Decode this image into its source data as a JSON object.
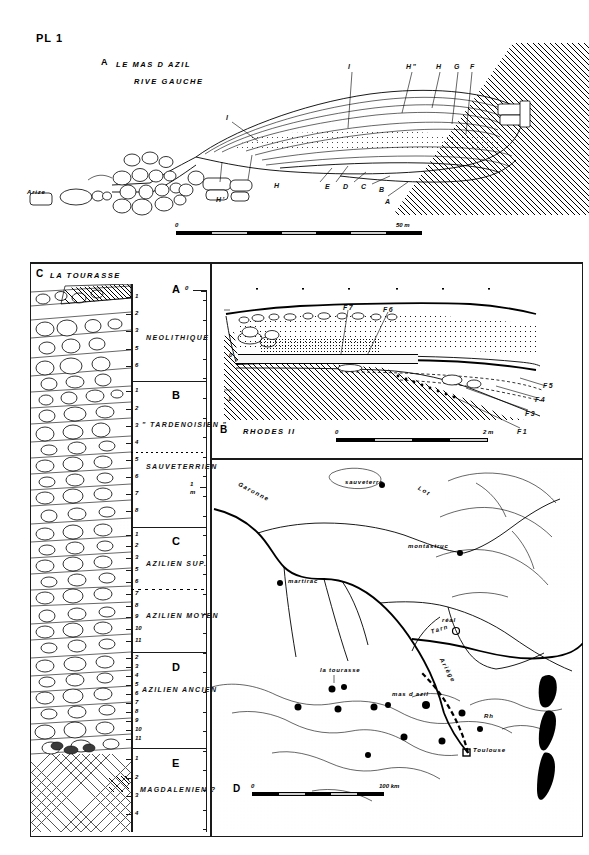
{
  "plate": {
    "number": "PL 1"
  },
  "panel_a": {
    "letter": "A",
    "title": "LE MAS D AZIL",
    "subtitle": "RIVE GAUCHE",
    "river_label": "Arize",
    "upper_labels": [
      "I",
      "H\"",
      "H",
      "G",
      "F"
    ],
    "lower_labels": [
      "H'",
      "H",
      "E",
      "D",
      "C",
      "B",
      "A"
    ],
    "scale": {
      "start": "0",
      "end": "50 m",
      "segments": 6
    }
  },
  "panel_c": {
    "letter": "C",
    "title": "LA TOURASSE",
    "depth_top": "0",
    "depth_mid": "1",
    "depth_mid_unit": "m",
    "zones": [
      {
        "letter": "A",
        "name": "NEOLITHIQUE",
        "layers": [
          "1",
          "2",
          "3",
          "5",
          "6"
        ]
      },
      {
        "letter": "B",
        "name": "\" TARDENOISIEN \"",
        "name2": "SAUVETERRIEN",
        "layers": [
          "1",
          "2",
          "3",
          "4",
          "5",
          "6",
          "7",
          "8"
        ]
      },
      {
        "letter": "C",
        "name": "AZILIEN SUP.",
        "name2": "AZILIEN MOYEN",
        "layers": [
          "1",
          "2",
          "3",
          "5",
          "6",
          "7",
          "8",
          "9",
          "10",
          "11"
        ]
      },
      {
        "letter": "D",
        "name": "AZILIEN ANCIEN",
        "layers": [
          "2",
          "3",
          "4",
          "5",
          "6",
          "7",
          "8",
          "9",
          "10",
          "11"
        ]
      },
      {
        "letter": "E",
        "name": "MAGDALENIEN ?",
        "layers": [
          "1",
          "2",
          "3",
          "4"
        ]
      }
    ]
  },
  "panel_b": {
    "letter": "B",
    "title": "RHODES II",
    "level_top": "0",
    "level_bottom": "-1",
    "labels": [
      "F7",
      "F6",
      "F5",
      "F4",
      "F3",
      "F1"
    ],
    "scale": {
      "start": "0",
      "end": "2 m",
      "segments": 4
    }
  },
  "panel_d": {
    "letter": "D",
    "rivers": [
      "Garonne",
      "Lot",
      "Tarn",
      "Ariège"
    ],
    "sites": [
      "sauveterre",
      "montastruc",
      "martirac",
      "réal",
      "Toulouse",
      "la tourasse",
      "mas d azil",
      "Rh"
    ],
    "scale": {
      "start": "0",
      "end": "100 km",
      "segments": 5
    }
  },
  "colors": {
    "ink": "#000000",
    "paper": "#ffffff",
    "grey": "#cfcfcf"
  }
}
